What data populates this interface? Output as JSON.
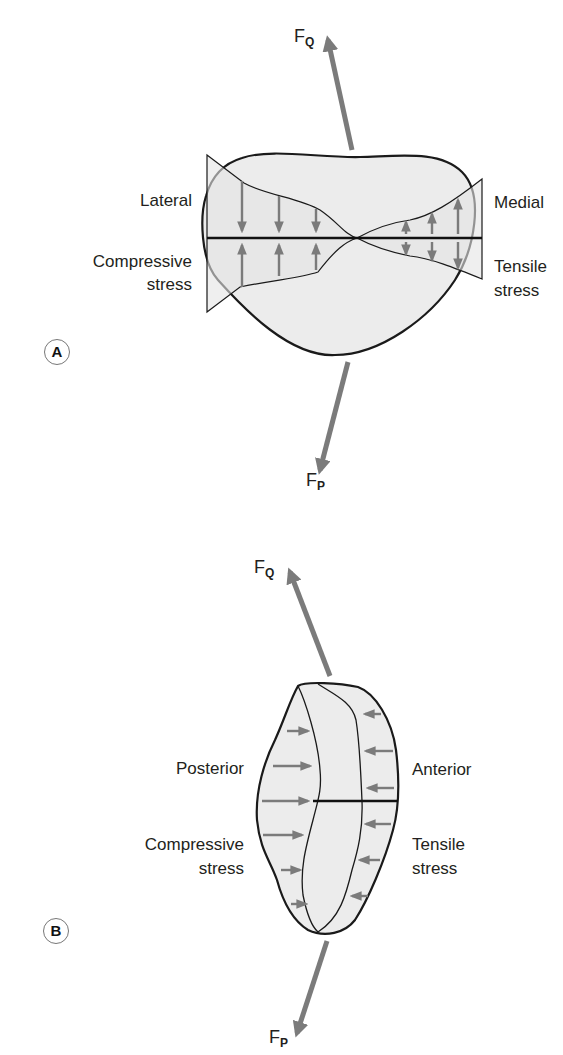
{
  "colors": {
    "outline": "#1a1a1a",
    "fill": "#ececec",
    "arrow": "#7b7b7b",
    "text": "#231f20"
  },
  "panel_a": {
    "badge": "A",
    "force_top": {
      "symbol": "F",
      "subscript": "Q"
    },
    "force_bottom": {
      "symbol": "F",
      "subscript": "P"
    },
    "label_left_top": "Lateral",
    "label_left_bottom_1": "Compressive",
    "label_left_bottom_2": "stress",
    "label_right_top": "Medial",
    "label_right_bottom_1": "Tensile",
    "label_right_bottom_2": "stress",
    "compressive_arrows": 3,
    "tensile_arrows": 3
  },
  "panel_b": {
    "badge": "B",
    "force_top": {
      "symbol": "F",
      "subscript": "Q"
    },
    "force_bottom": {
      "symbol": "F",
      "subscript": "P"
    },
    "label_left_top": "Posterior",
    "label_left_bottom_1": "Compressive",
    "label_left_bottom_2": "stress",
    "label_right_top": "Anterior",
    "label_right_bottom_1": "Tensile",
    "label_right_bottom_2": "stress",
    "compressive_arrows": 6,
    "tensile_arrows": 6
  }
}
